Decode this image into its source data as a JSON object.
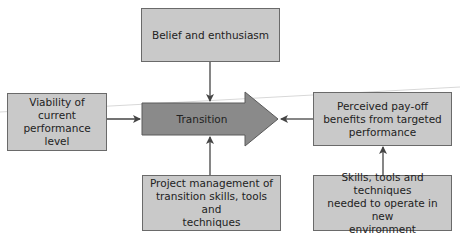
{
  "diagram": {
    "center": {
      "label": "Transition"
    },
    "nodes": {
      "top": {
        "label": "Belief and enthusiasm"
      },
      "left": {
        "label": "Viability of current\nperformance level"
      },
      "right": {
        "label": "Perceived pay-off\nbenefits from targeted\nperformance"
      },
      "bottom": {
        "label": "Project management of\ntransition skills, tools and\ntechniques"
      },
      "bottom_right": {
        "label": "Skills, tools and techniques\nneeded to operate in new\nenvironment"
      }
    },
    "edges": [
      {
        "from": "top",
        "to": "center"
      },
      {
        "from": "left",
        "to": "center"
      },
      {
        "from": "right",
        "to": "center"
      },
      {
        "from": "bottom",
        "to": "center"
      },
      {
        "from": "bottom_right",
        "to": "right"
      }
    ],
    "colors": {
      "box_fill": "#c9c9c9",
      "arrow_fill": "#8a8a8a",
      "border": "#6a6a6a",
      "connector": "#444444"
    }
  }
}
